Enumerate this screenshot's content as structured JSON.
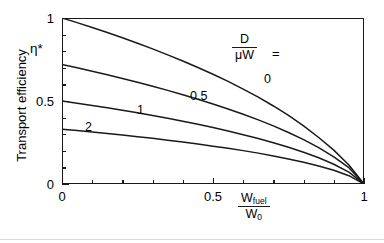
{
  "chart_data": {
    "type": "line",
    "title": "",
    "xlabel": "W_fuel / W_0",
    "ylabel": "Transport efficiency",
    "xlim": [
      0,
      1
    ],
    "ylim": [
      0,
      1
    ],
    "grid": false,
    "legend_position": "inside-top-right",
    "legend_title": "D / (mu W) =",
    "x_ticks": [
      {
        "value": 0,
        "label": "0",
        "major": true
      },
      {
        "value": 0.1,
        "label": "",
        "major": false
      },
      {
        "value": 0.2,
        "label": "",
        "major": false
      },
      {
        "value": 0.3,
        "label": "",
        "major": false
      },
      {
        "value": 0.4,
        "label": "",
        "major": false
      },
      {
        "value": 0.5,
        "label": "0.5",
        "major": true
      },
      {
        "value": 0.6,
        "label": "",
        "major": false
      },
      {
        "value": 0.7,
        "label": "",
        "major": false
      },
      {
        "value": 0.8,
        "label": "",
        "major": false
      },
      {
        "value": 0.9,
        "label": "",
        "major": false
      },
      {
        "value": 1.0,
        "label": "1",
        "major": true
      }
    ],
    "y_ticks": [
      {
        "value": 0,
        "label": "0",
        "major": true
      },
      {
        "value": 0.1,
        "label": "",
        "major": false
      },
      {
        "value": 0.2,
        "label": "",
        "major": false
      },
      {
        "value": 0.3,
        "label": "",
        "major": false
      },
      {
        "value": 0.4,
        "label": "",
        "major": false
      },
      {
        "value": 0.5,
        "label": "0.5",
        "major": true
      },
      {
        "value": 0.6,
        "label": "",
        "major": false
      },
      {
        "value": 0.7,
        "label": "",
        "major": false
      },
      {
        "value": 0.8,
        "label": "",
        "major": false
      },
      {
        "value": 0.9,
        "label": "",
        "major": false
      },
      {
        "value": 1.0,
        "label": "1",
        "major": true
      }
    ],
    "x": [
      0,
      0.05,
      0.1,
      0.15,
      0.2,
      0.25,
      0.3,
      0.35,
      0.4,
      0.45,
      0.5,
      0.55,
      0.6,
      0.65,
      0.7,
      0.75,
      0.8,
      0.85,
      0.9,
      0.95,
      1.0
    ],
    "series": [
      {
        "name": "0",
        "label": "0",
        "color": "#1a1a1a",
        "values": [
          1.0,
          0.972,
          0.943,
          0.913,
          0.881,
          0.848,
          0.814,
          0.778,
          0.741,
          0.702,
          0.661,
          0.618,
          0.572,
          0.523,
          0.47,
          0.413,
          0.35,
          0.28,
          0.204,
          0.114,
          0.0
        ]
      },
      {
        "name": "0.5",
        "label": "0.5",
        "color": "#1a1a1a",
        "values": [
          0.72,
          0.7,
          0.679,
          0.658,
          0.636,
          0.613,
          0.589,
          0.564,
          0.538,
          0.511,
          0.482,
          0.452,
          0.42,
          0.386,
          0.35,
          0.31,
          0.267,
          0.219,
          0.164,
          0.098,
          0.0
        ]
      },
      {
        "name": "1",
        "label": "1",
        "color": "#1a1a1a",
        "values": [
          0.5,
          0.487,
          0.473,
          0.459,
          0.444,
          0.429,
          0.413,
          0.396,
          0.378,
          0.36,
          0.34,
          0.319,
          0.297,
          0.274,
          0.249,
          0.221,
          0.191,
          0.158,
          0.119,
          0.072,
          0.0
        ]
      },
      {
        "name": "2",
        "label": "2",
        "color": "#1a1a1a",
        "values": [
          0.33,
          0.322,
          0.313,
          0.304,
          0.295,
          0.285,
          0.275,
          0.264,
          0.253,
          0.241,
          0.228,
          0.215,
          0.201,
          0.186,
          0.169,
          0.151,
          0.131,
          0.109,
          0.083,
          0.05,
          0.0
        ]
      }
    ]
  },
  "axes": {
    "y_title": "Transport efficiency",
    "eta_symbol": "η*",
    "x_title": {
      "numerator": "W",
      "numerator_sub": "fuel",
      "denominator": "W",
      "denominator_sub": "0"
    },
    "y_labels": [
      "1",
      "0.5",
      "0"
    ],
    "x_labels": [
      "0",
      "0.5",
      "1"
    ]
  },
  "legend": {
    "numerator": "D",
    "denominator": "μW",
    "equals": "=",
    "curve_labels": [
      "0",
      "0.5",
      "1",
      "2"
    ]
  },
  "colors": {
    "line": "#1a1a1a",
    "background": "#ffffff"
  }
}
